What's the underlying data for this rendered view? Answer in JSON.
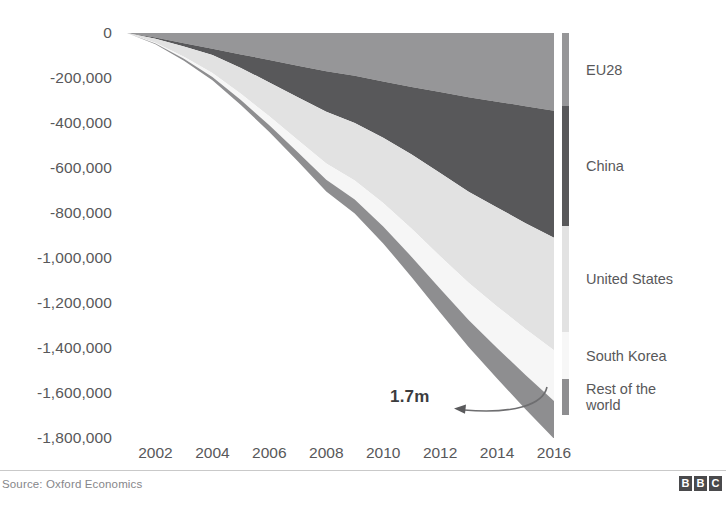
{
  "chart_data": {
    "type": "area",
    "stacked": true,
    "title": "",
    "subtitle": "",
    "xlabel": "",
    "ylabel": "",
    "xlim": [
      2001,
      2016
    ],
    "ylim": [
      -1800000,
      0
    ],
    "grid": false,
    "legend_position": "right",
    "x": [
      2001,
      2002,
      2003,
      2004,
      2005,
      2006,
      2007,
      2008,
      2009,
      2010,
      2011,
      2012,
      2013,
      2014,
      2015,
      2016
    ],
    "x_tick_labels": [
      "2002",
      "2004",
      "2006",
      "2008",
      "2010",
      "2012",
      "2014",
      "2016"
    ],
    "x_ticks": [
      2002,
      2004,
      2006,
      2008,
      2010,
      2012,
      2014,
      2016
    ],
    "y_tick_labels": [
      "0",
      "-200,000",
      "-400,000",
      "-600,000",
      "-800,000",
      "-1,000,000",
      "-1,200,000",
      "-1,400,000",
      "-1,600,000",
      "-1,800,000"
    ],
    "y_ticks": [
      0,
      -200000,
      -400000,
      -600000,
      -800000,
      -1000000,
      -1200000,
      -1400000,
      -1600000,
      -1800000
    ],
    "series": [
      {
        "name": "EU28",
        "color": "#969698",
        "values": [
          0,
          -20000,
          -45000,
          -70000,
          -95000,
          -120000,
          -145000,
          -170000,
          -190000,
          -215000,
          -240000,
          -262000,
          -285000,
          -305000,
          -325000,
          -345000
        ]
      },
      {
        "name": "China",
        "color": "#58585a",
        "values": [
          0,
          -5000,
          -15000,
          -28000,
          -60000,
          -100000,
          -140000,
          -180000,
          -210000,
          -250000,
          -300000,
          -360000,
          -420000,
          -470000,
          -520000,
          -565000
        ]
      },
      {
        "name": "United States",
        "color": "#e2e2e2",
        "values": [
          0,
          -18000,
          -45000,
          -80000,
          -115000,
          -150000,
          -190000,
          -230000,
          -255000,
          -290000,
          -330000,
          -370000,
          -405000,
          -440000,
          -470000,
          -500000
        ]
      },
      {
        "name": "South Korea",
        "color": "#f6f6f6",
        "values": [
          0,
          -4000,
          -10000,
          -18000,
          -28000,
          -40000,
          -55000,
          -72000,
          -85000,
          -105000,
          -125000,
          -145000,
          -165000,
          -185000,
          -205000,
          -225000
        ]
      },
      {
        "name": "Rest of the\nworld",
        "color": "#8e8e90",
        "values": [
          0,
          -3000,
          -8000,
          -14000,
          -22000,
          -30000,
          -40000,
          -52000,
          -62000,
          -75000,
          -90000,
          -105000,
          -120000,
          -135000,
          -152000,
          -168000
        ]
      }
    ],
    "annotations": [
      {
        "text": "1.7m",
        "type": "curved-arrow-left",
        "points_to_year": 2016,
        "points_to_value": -1700000
      }
    ]
  },
  "legend": {
    "items": [
      {
        "label": "EU28",
        "color": "#969698"
      },
      {
        "label": "China",
        "color": "#58585a"
      },
      {
        "label": "United States",
        "color": "#e2e2e2"
      },
      {
        "label": "South Korea",
        "color": "#f7f7f7"
      },
      {
        "label": "Rest of the\nworld",
        "color": "#8e8e90"
      }
    ]
  },
  "footer": {
    "source": "Source: Oxford Economics",
    "logo_letters": [
      "B",
      "B",
      "C"
    ]
  },
  "colors": {
    "text": "#58585a",
    "rule": "#c9c9c9",
    "background": "#ffffff",
    "annotation": "#3c3c3e"
  }
}
